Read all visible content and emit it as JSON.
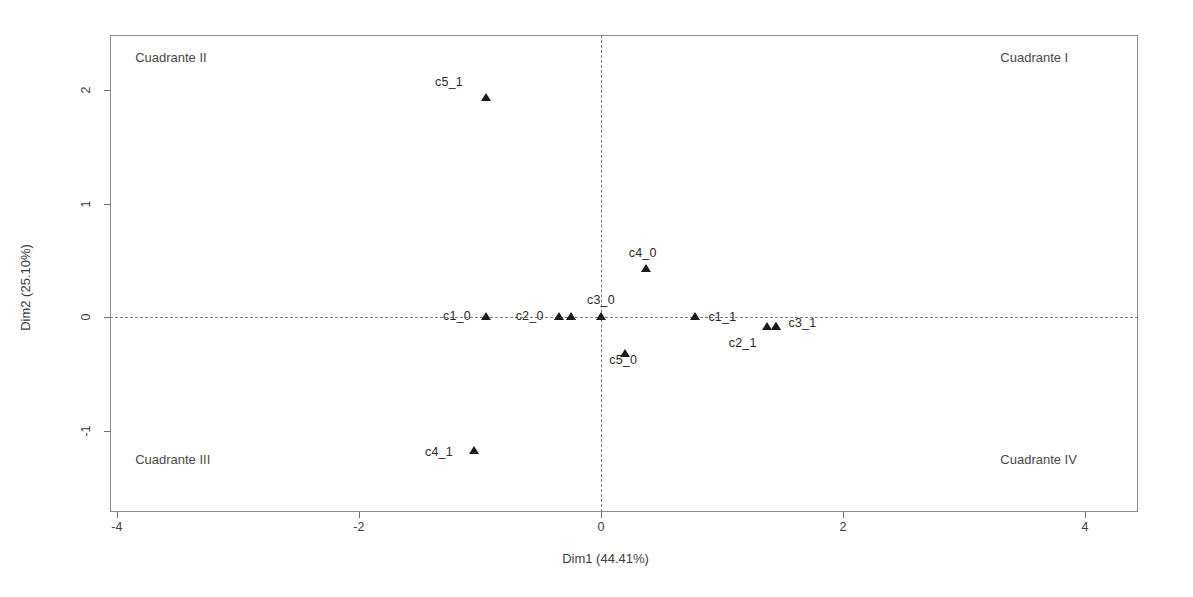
{
  "chart_data": {
    "type": "scatter",
    "title": "",
    "xlabel": "Dim1 (44.41%)",
    "ylabel": "Dim2 (25.10%)",
    "xlim": [
      -4.38,
      4.43
    ],
    "ylim": [
      -1.48,
      2.48
    ],
    "xticks": [
      -4,
      -2,
      0,
      2,
      4
    ],
    "xticklabels": [
      "-4",
      "-2",
      "0",
      "2",
      "4"
    ],
    "yticks": [
      2,
      1,
      0,
      -1
    ],
    "yticklabels": [
      "2",
      "1",
      "0",
      "-1"
    ],
    "grid": false,
    "legend": null,
    "reference_lines": {
      "vertical_x": 0,
      "horizontal_y": 0,
      "style": "dashed"
    },
    "annotations": [
      {
        "name": "quadrant-2",
        "text": "Cuadrante II",
        "x": -3.85,
        "y": 2.28
      },
      {
        "name": "quadrant-1",
        "text": "Cuadrante I",
        "x": 3.3,
        "y": 2.28
      },
      {
        "name": "quadrant-3",
        "text": "Cuadrante III",
        "x": -3.85,
        "y": -1.26
      },
      {
        "name": "quadrant-4",
        "text": "Cuadrante IV",
        "x": 3.3,
        "y": -1.26
      }
    ],
    "points": [
      {
        "label": "c5_1",
        "x": -0.95,
        "y": 1.93,
        "label_dx": -51,
        "label_dy": -13
      },
      {
        "label": "c4_0",
        "x": 0.37,
        "y": 0.42,
        "label_dx": -17,
        "label_dy": -13
      },
      {
        "label": "c1_0",
        "x": -0.95,
        "y": 0.0,
        "label_dx": -43,
        "label_dy": 2
      },
      {
        "label": "c2_0",
        "x": -0.35,
        "y": 0.0,
        "label_dx": -43,
        "label_dy": 2
      },
      {
        "label": "",
        "x": -0.25,
        "y": 0.0,
        "label_dx": 0,
        "label_dy": 0
      },
      {
        "label": "c3_0",
        "x": 0.0,
        "y": 0.0,
        "label_dx": -14,
        "label_dy": -14
      },
      {
        "label": "c1_1",
        "x": 0.78,
        "y": 0.0,
        "label_dx": 13,
        "label_dy": 3
      },
      {
        "label": "c2_1",
        "x": 1.37,
        "y": -0.09,
        "label_dx": -38,
        "label_dy": 19
      },
      {
        "label": "",
        "x": 1.45,
        "y": -0.09,
        "label_dx": 0,
        "label_dy": 0
      },
      {
        "label": "c3_1",
        "x": 1.45,
        "y": -0.09,
        "label_dx": 12,
        "label_dy": -1
      },
      {
        "label": "c5_0",
        "x": 0.2,
        "y": -0.33,
        "label_dx": -16,
        "label_dy": 9
      },
      {
        "label": "c4_1",
        "x": -1.05,
        "y": -1.18,
        "label_dx": -49,
        "label_dy": 4
      }
    ]
  }
}
